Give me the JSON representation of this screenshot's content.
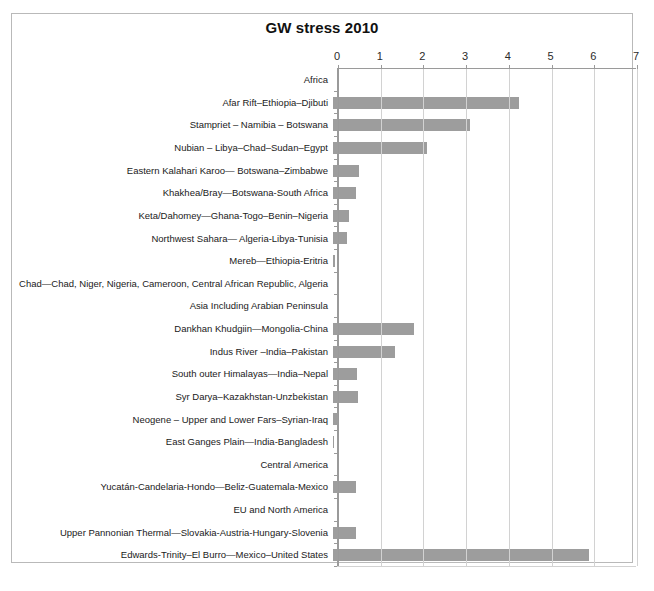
{
  "chart_data": {
    "type": "bar",
    "orientation": "horizontal",
    "title": "GW stress 2010",
    "xlabel": "",
    "ylabel": "",
    "xlim": [
      0,
      7
    ],
    "xticks": [
      0,
      1,
      2,
      3,
      4,
      5,
      6,
      7
    ],
    "xtick_labels": [
      "0",
      "1",
      "2",
      "3",
      "4",
      "5",
      "6",
      "7"
    ],
    "grid": true,
    "legend": "none",
    "bar_color": "#9d9d9d",
    "gridline_color": "#d2d2d2",
    "axis_color": "#9a9a9a",
    "categories": [
      "Africa",
      "Afar Rift–Ethiopia–Djibuti",
      "Stampriet – Namibia – Botswana",
      "Nubian – Libya–Chad–Sudan–Egypt",
      "Eastern  Kalahari Karoo— Botswana–Zimbabwe",
      "Khakhea/Bray—Botswana-South Africa",
      "Keta/Dahomey—Ghana-Togo–Benin–Nigeria",
      "Northwest Sahara— Algeria-Libya-Tunisia",
      "Mereb—Ethiopia-Eritria",
      "Chad—Chad, Niger, Nigeria, Cameroon,  Central African Republic, Algeria",
      "Asia Including Arabian Peninsula",
      "Dankhan Khudgiin—Mongolia-China",
      "Indus River –India–Pakistan",
      "South outer Himalayas—India–Nepal",
      "Syr Darya–Kazakhstan-Unzbekistan",
      "Neogene – Upper and Lower Fars–Syrian-Iraq",
      "East Ganges Plain—India-Bangladesh",
      "Central America",
      "Yucatán-Candelaria-Hondo—Beliz-Guatemala-Mexico",
      "EU and North America",
      "Upper Pannonian Thermal—Slovakia-Austria-Hungary-Slovenia",
      "Edwards-Trinity–El Burro—Mexico–United States"
    ],
    "values": [
      0,
      4.35,
      3.2,
      2.2,
      0.62,
      0.55,
      0.37,
      0.33,
      0.04,
      0,
      0,
      1.9,
      1.45,
      0.57,
      0.58,
      0.12,
      0.03,
      0,
      0.53,
      0,
      0.55,
      6.0
    ],
    "is_group_header": [
      true,
      false,
      false,
      false,
      false,
      false,
      false,
      false,
      false,
      true,
      true,
      false,
      false,
      false,
      false,
      false,
      false,
      true,
      false,
      true,
      false,
      false
    ]
  }
}
